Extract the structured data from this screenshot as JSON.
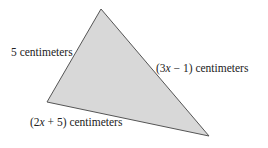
{
  "diagram": {
    "type": "triangle",
    "fill_color": "#d8d8d8",
    "stroke_color": "#555555",
    "vertices": {
      "top": [
        101,
        9
      ],
      "left": [
        47,
        102
      ],
      "right": [
        209,
        136
      ]
    },
    "sides": [
      {
        "id": "left-side",
        "label": "5 centimeters"
      },
      {
        "id": "right-side",
        "label_prefix": "(3",
        "label_var": "x",
        "label_suffix": " − 1) centimeters"
      },
      {
        "id": "bottom-side",
        "label_prefix": "(2",
        "label_var": "x",
        "label_suffix": " + 5) centimeters"
      }
    ]
  }
}
